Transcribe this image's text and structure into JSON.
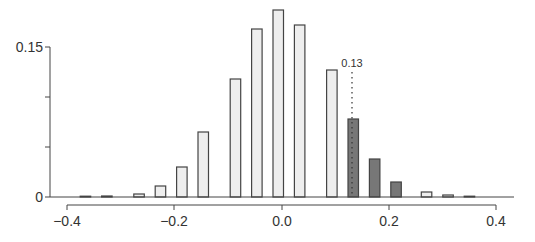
{
  "chart_data": {
    "type": "bar",
    "title": "",
    "xlabel": "",
    "ylabel": "",
    "xlim": [
      -0.4,
      0.4
    ],
    "ylim": [
      0,
      0.15
    ],
    "grid": false,
    "legend": null,
    "x_ticks": [
      -0.4,
      -0.2,
      0.0,
      0.2,
      0.4
    ],
    "x_tick_labels": [
      "−0.4",
      "−0.2",
      "0.0",
      "0.2",
      "0.4"
    ],
    "y_ticks": [
      0,
      0.05,
      0.1,
      0.15
    ],
    "y_tick_labels": [
      "0",
      "",
      "",
      "0.15"
    ],
    "bars": [
      {
        "x": -0.367,
        "height": 0.0003,
        "highlight": false
      },
      {
        "x": -0.327,
        "height": 0.001,
        "highlight": false
      },
      {
        "x": -0.267,
        "height": 0.003,
        "highlight": false
      },
      {
        "x": -0.227,
        "height": 0.011,
        "highlight": false
      },
      {
        "x": -0.187,
        "height": 0.03,
        "highlight": false
      },
      {
        "x": -0.147,
        "height": 0.065,
        "highlight": false
      },
      {
        "x": -0.087,
        "height": 0.118,
        "highlight": false
      },
      {
        "x": -0.047,
        "height": 0.168,
        "highlight": false
      },
      {
        "x": -0.007,
        "height": 0.187,
        "highlight": false
      },
      {
        "x": 0.033,
        "height": 0.172,
        "highlight": false
      },
      {
        "x": 0.093,
        "height": 0.127,
        "highlight": false
      },
      {
        "x": 0.133,
        "height": 0.078,
        "highlight": true
      },
      {
        "x": 0.173,
        "height": 0.038,
        "highlight": true
      },
      {
        "x": 0.213,
        "height": 0.015,
        "highlight": true
      },
      {
        "x": 0.27,
        "height": 0.005,
        "highlight": false
      },
      {
        "x": 0.31,
        "height": 0.002,
        "highlight": false
      },
      {
        "x": 0.35,
        "height": 0.0005,
        "highlight": false
      }
    ],
    "annotations": [
      {
        "type": "dotted-vline",
        "x": 0.13,
        "label": "0.13"
      }
    ],
    "colors": {
      "bar_fill": "#eeeeee",
      "highlight_fill": "#777777",
      "bar_stroke": "#444444",
      "axis": "#444444"
    }
  },
  "annotation": {
    "label": "0.13"
  },
  "axes": {
    "x_tick_labels": [
      "−0.4",
      "−0.2",
      "0.0",
      "0.2",
      "0.4"
    ],
    "y_tick_labels": {
      "top": "0.15",
      "bottom": "0"
    }
  }
}
